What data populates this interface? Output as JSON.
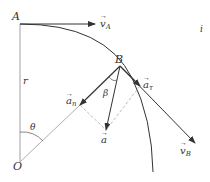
{
  "diagram": {
    "type": "circular-motion-kinematics",
    "points": {
      "A": {
        "label": "A"
      },
      "B": {
        "label": "B"
      },
      "O": {
        "label": "O"
      }
    },
    "labels": {
      "radius": "r",
      "angle_theta": "θ",
      "angle_beta": "β",
      "velocity_A": "v",
      "velocity_A_sub": "A",
      "velocity_B": "v",
      "velocity_B_sub": "B",
      "accel_normal": "a",
      "accel_normal_sub": "n",
      "accel_tangential": "a",
      "accel_tangential_sub": "τ",
      "accel_total": "a",
      "corner_mark": "i"
    },
    "colors": {
      "line": "#333333",
      "dashed": "#aaaaaa",
      "thin": "#888888"
    }
  }
}
